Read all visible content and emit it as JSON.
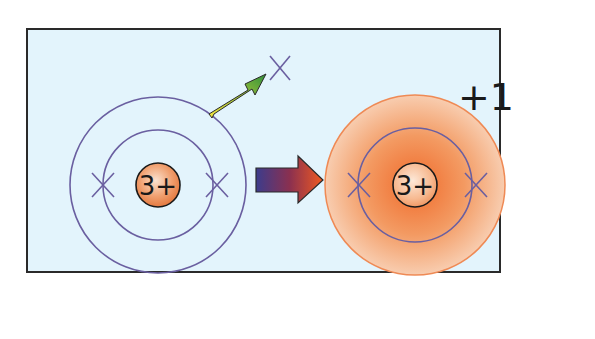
{
  "diagram": {
    "colors": {
      "panel_bg": "#e3f4fc",
      "panel_border": "#2a2a2a",
      "orbit": "#6a5fa0",
      "electron": "#6a5fa0",
      "ion_glow_outer": "#f6c4a0",
      "ion_glow_inner": "#f07a3c",
      "ion_border": "#ef8a55",
      "nucleus_fill": "#f0a070",
      "nucleus_border": "#1a1a1a",
      "arrow_start": "#3c3c8c",
      "arrow_end": "#f05a20",
      "small_arrow_start": "#f0e040",
      "small_arrow_end": "#3a9a3a"
    },
    "atom": {
      "nucleus_label": "3+",
      "electron_symbol": "×",
      "shells": 2,
      "inner_shell_electrons": 2,
      "outer_shell_electrons": 1
    },
    "ion": {
      "nucleus_label": "3+",
      "charge_label": "+1",
      "electron_symbol": "×",
      "inner_shell_electrons": 2
    },
    "arrows": {
      "electron_leaving": "electron-removed-arrow",
      "transform": "forms-ion-arrow"
    }
  }
}
